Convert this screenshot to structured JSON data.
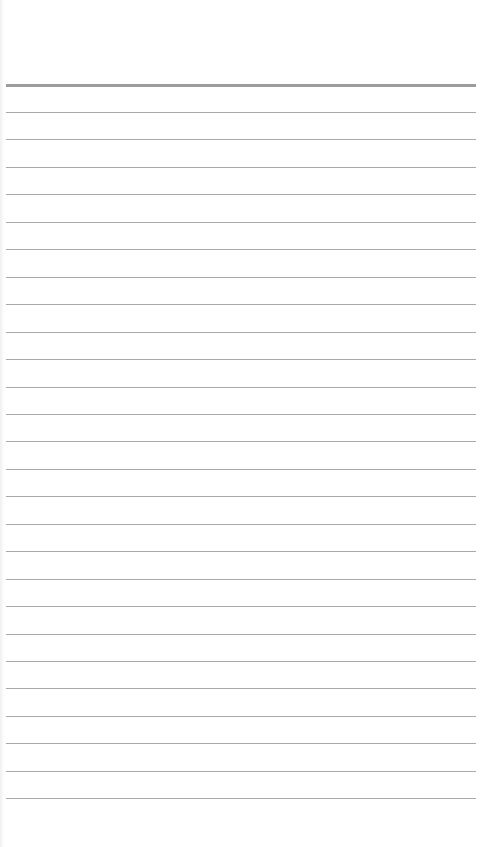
{
  "paper": {
    "type": "ruled-lined-paper",
    "background_color": "#ffffff",
    "line_color": "#a8a8a8",
    "header_line_color": "#9c9c9c",
    "header_line_y": 84,
    "first_ruled_line_y": 112,
    "line_spacing": 27.45,
    "ruled_line_count": 26,
    "line_left_x": 6,
    "line_right_x": 476
  }
}
